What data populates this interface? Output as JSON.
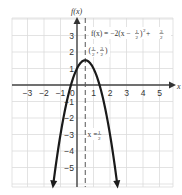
{
  "chart_data": {
    "type": "line",
    "title": "",
    "xlabel": "x",
    "ylabel": "f(x)",
    "xlim": [
      -3.9,
      5.8
    ],
    "ylim": [
      -6.2,
      4.1
    ],
    "grid": true,
    "x_ticks": [
      "-3",
      "-2",
      "-1",
      "0",
      "1",
      "2",
      "3",
      "4",
      "5"
    ],
    "y_ticks": [
      "3",
      "2",
      "1",
      "-1",
      "-2",
      "-3",
      "-4",
      "-5"
    ],
    "series": [
      {
        "name": "f(x) = -2(x - 1/2)^2 + 3/2",
        "function": "-2*(x-0.5)^2+1.5",
        "x_range": [
          -1.44,
          2.44
        ],
        "arrows_at_ends": true
      }
    ],
    "annotations": {
      "equation": "f(x) = −2(x − ½)² + ³⁄₂",
      "vertex": {
        "x": 0.5,
        "y": 1.5,
        "label": "(½, ³⁄₂)"
      },
      "axis_of_symmetry": {
        "x": 0.5,
        "label": "x = ½",
        "style": "dashed"
      }
    }
  },
  "labels": {
    "y_axis": "f(x)",
    "x_axis": "x",
    "eq_prefix": "f(x) = −2(x − ",
    "eq_mid": ")",
    "eq_sq": "2",
    "eq_plus": " + ",
    "vertex_open": "(",
    "vertex_comma": ",",
    "vertex_close": ")",
    "sym_prefix": "x = ",
    "half_num": "1",
    "half_den": "2",
    "threehalf_num": "3",
    "threehalf_den": "2"
  },
  "colors": {
    "grid": "#d9d9d9",
    "axis": "#444444",
    "curve": "#1a1a1a"
  }
}
